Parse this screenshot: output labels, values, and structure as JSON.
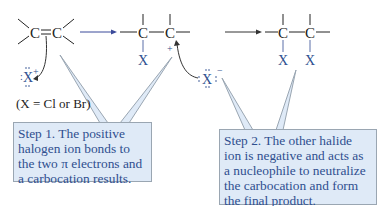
{
  "diagram": {
    "reactant": {
      "atoms": [
        "C",
        "C"
      ],
      "bond": "double"
    },
    "electrophile": {
      "symbol": "X",
      "charge": "+"
    },
    "note": "(X = Cl or Br)",
    "intermediate": {
      "atoms": [
        "C",
        "C"
      ],
      "substituent": "X",
      "charge": "+"
    },
    "nucleophile": {
      "symbol": "X",
      "charge": "−"
    },
    "product": {
      "atoms": [
        "C",
        "C"
      ],
      "substituents": [
        "X",
        "X"
      ]
    },
    "colors": {
      "text": "#222222",
      "halogen": "#2f4f8f",
      "callout_bg": "#dfeaf7",
      "callout_border": "#9aa6b2",
      "arrow": "#3b4a9a"
    }
  },
  "callouts": {
    "step1": "Step 1.  The positive halogen ion bonds to the two π electrons and a carbocation results.",
    "step2": "Step 2.  The other halide ion is negative and acts as a nucleophile to neutralize the carbocation and form the final product."
  }
}
